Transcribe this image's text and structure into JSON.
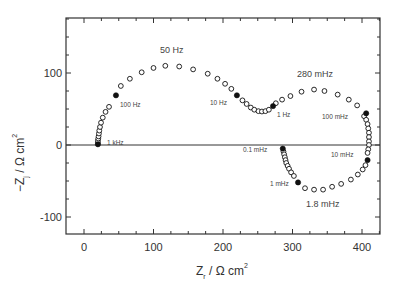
{
  "chart_data": {
    "type": "scatter",
    "title": "",
    "xlabel": "Z_r / Ω cm²",
    "ylabel": "−Z_j / Ω cm²",
    "xlim": [
      -25,
      427
    ],
    "ylim": [
      -125,
      176
    ],
    "xticks": [
      0,
      100,
      200,
      300,
      400
    ],
    "yticks": [
      -100,
      0,
      100
    ],
    "grid": false,
    "legend": null,
    "zero_line": true,
    "series": [
      {
        "name": "impedance (open)",
        "marker": "open-circle",
        "points": [
          [
            20,
            3
          ],
          [
            20,
            6
          ],
          [
            20.5,
            9
          ],
          [
            21,
            12
          ],
          [
            21.5,
            16
          ],
          [
            22,
            20
          ],
          [
            23,
            25
          ],
          [
            24.5,
            31
          ],
          [
            27,
            38
          ],
          [
            31,
            46
          ],
          [
            36,
            53
          ],
          [
            53,
            82
          ],
          [
            66,
            92
          ],
          [
            83,
            101
          ],
          [
            100,
            107
          ],
          [
            117,
            110
          ],
          [
            137,
            109
          ],
          [
            157,
            105
          ],
          [
            178,
            99
          ],
          [
            192,
            92
          ],
          [
            203,
            85
          ],
          [
            212,
            78
          ],
          [
            228,
            62
          ],
          [
            234,
            57
          ],
          [
            240,
            52
          ],
          [
            245,
            49
          ],
          [
            251,
            47
          ],
          [
            256,
            46.5
          ],
          [
            261,
            47
          ],
          [
            266,
            49
          ],
          [
            276,
            58
          ],
          [
            285,
            63
          ],
          [
            297,
            68
          ],
          [
            313,
            74
          ],
          [
            331,
            77
          ],
          [
            346,
            75
          ],
          [
            365,
            70
          ],
          [
            381,
            63
          ],
          [
            393,
            55
          ],
          [
            403,
            40
          ],
          [
            406,
            35
          ],
          [
            408,
            29
          ],
          [
            409,
            23
          ],
          [
            410,
            17
          ],
          [
            410,
            11
          ],
          [
            410,
            5
          ],
          [
            410,
            0
          ],
          [
            409,
            -6
          ],
          [
            408,
            -11
          ],
          [
            405,
            -28
          ],
          [
            401,
            -34
          ],
          [
            394,
            -41
          ],
          [
            384,
            -48
          ],
          [
            370,
            -54
          ],
          [
            357,
            -58
          ],
          [
            344,
            -62
          ],
          [
            331,
            -62
          ],
          [
            318,
            -60
          ],
          [
            287,
            -9
          ],
          [
            288,
            -13
          ],
          [
            289,
            -17
          ],
          [
            290,
            -21
          ],
          [
            291,
            -25
          ],
          [
            293,
            -29
          ],
          [
            295,
            -33
          ],
          [
            298,
            -38
          ],
          [
            302,
            -43
          ]
        ]
      },
      {
        "name": "marked frequencies (filled)",
        "marker": "filled-circle",
        "points": [
          [
            20,
            1,
            "1 kHz"
          ],
          [
            46,
            69,
            "100 Hz"
          ],
          [
            220,
            69,
            "10 Hz"
          ],
          [
            272,
            54,
            "1 Hz"
          ],
          [
            406,
            44,
            "100 mHz"
          ],
          [
            408,
            -21,
            "10 mHz"
          ],
          [
            308,
            -52,
            "1 mHz"
          ],
          [
            286,
            -5,
            "0.1 mHz"
          ]
        ]
      }
    ],
    "annotations": [
      {
        "text": "50 Hz",
        "x": 128,
        "y": 129
      },
      {
        "text": "100 Hz",
        "x": 52,
        "y": 55
      },
      {
        "text": "1 kHz",
        "x": 33,
        "y": 4
      },
      {
        "text": "10 Hz",
        "x": 182,
        "y": 50
      },
      {
        "text": "1 Hz",
        "x": 279,
        "y": 36
      },
      {
        "text": "280 mHz",
        "x": 311,
        "y": 98
      },
      {
        "text": "100 mHz",
        "x": 349,
        "y": 35
      },
      {
        "text": "0.1 mHz",
        "x": 247,
        "y": -6
      },
      {
        "text": "10 mHz",
        "x": 365,
        "y": -11
      },
      {
        "text": "1 mHz",
        "x": 269,
        "y": -46
      },
      {
        "text": "1.8 mHz",
        "x": 323,
        "y": -83
      }
    ]
  },
  "axes": {
    "x_tick_labels": [
      "0",
      "100",
      "200",
      "300",
      "400"
    ],
    "y_tick_labels": [
      "100",
      "0",
      "-100"
    ],
    "x_title_main": "Z",
    "x_title_sub": "r",
    "x_title_rest": " / Ω cm",
    "x_title_sup": "2",
    "y_title_main": "−Z",
    "y_title_sub": "j",
    "y_title_rest": " / Ω cm",
    "y_title_sup": "2"
  },
  "labels": {
    "f50Hz": "50 Hz",
    "f100Hz": "100 Hz",
    "f1kHz": "1 kHz",
    "f10Hz": "10 Hz",
    "f1Hz": "1 Hz",
    "f280mHz": "280 mHz",
    "f100mHz": "100 mHz",
    "f0_1mHz": "0.1 mHz",
    "f10mHz": "10 mHz",
    "f1mHz": "1 mHz",
    "f1_8mHz": "1.8 mHz"
  },
  "colors": {
    "axis": "#333333",
    "marker": "#111111",
    "background": "#ffffff"
  }
}
